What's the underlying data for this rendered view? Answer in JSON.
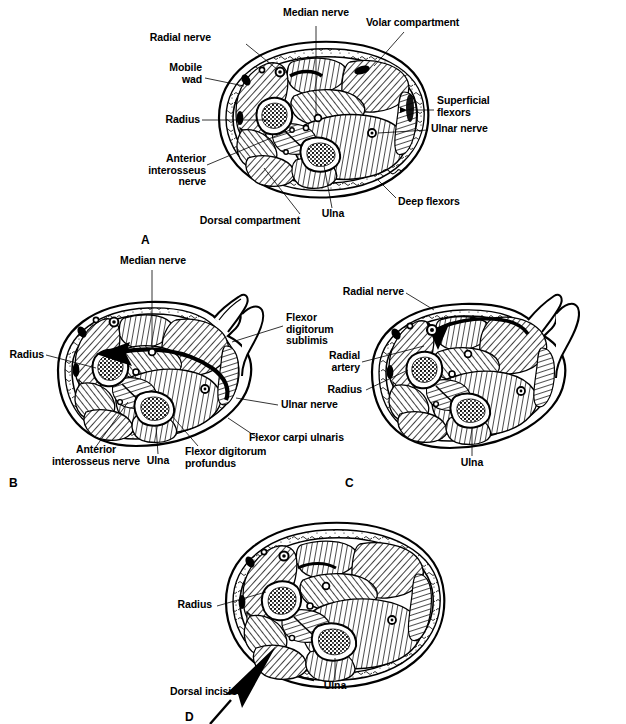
{
  "figure": {
    "line_color": "#000000",
    "background_color": "#ffffff"
  },
  "panels": [
    {
      "id": "A",
      "letter": "A",
      "caption": "Normal forearm cross-section anatomy",
      "labels": [
        {
          "name": "median-nerve",
          "text": "Median nerve"
        },
        {
          "name": "volar-compartment",
          "text": "Volar compartment"
        },
        {
          "name": "radial-nerve",
          "text": "Radial nerve"
        },
        {
          "name": "mobile-wad",
          "text": "Mobile\nwad"
        },
        {
          "name": "superficial-flexors",
          "text": "Superficial\nflexors"
        },
        {
          "name": "radius",
          "text": "Radius"
        },
        {
          "name": "ulnar-nerve",
          "text": "Ulnar nerve"
        },
        {
          "name": "anterior-interosseus-nerve",
          "text": "Anterior\ninterosseus\nnerve"
        },
        {
          "name": "deep-flexors",
          "text": "Deep flexors"
        },
        {
          "name": "dorsal-compartment",
          "text": "Dorsal compartment"
        },
        {
          "name": "ulna",
          "text": "Ulna"
        }
      ]
    },
    {
      "id": "B",
      "letter": "B",
      "caption": "Volar fasciotomy release with arrow through median nerve level",
      "labels": [
        {
          "name": "median-nerve",
          "text": "Median nerve"
        },
        {
          "name": "flexor-digitorum-sublimis",
          "text": "Flexor\ndigitorum\nsublimis"
        },
        {
          "name": "radius",
          "text": "Radius"
        },
        {
          "name": "ulnar-nerve",
          "text": "Ulnar nerve"
        },
        {
          "name": "flexor-carpi-ulnaris",
          "text": "Flexor carpi ulnaris"
        },
        {
          "name": "anterior-interosseus-nerve",
          "text": "Anterior\ninterosseus nerve"
        },
        {
          "name": "ulna",
          "text": "Ulna"
        },
        {
          "name": "flexor-digitorum-profundus",
          "text": "Flexor digitorum\nprofundus"
        }
      ]
    },
    {
      "id": "C",
      "letter": "C",
      "caption": "Mobile wad release showing radial nerve and radial artery",
      "labels": [
        {
          "name": "radial-nerve",
          "text": "Radial nerve"
        },
        {
          "name": "radial-artery",
          "text": "Radial\nartery"
        },
        {
          "name": "radius",
          "text": "Radius"
        },
        {
          "name": "ulna",
          "text": "Ulna"
        }
      ]
    },
    {
      "id": "D",
      "letter": "D",
      "caption": "Dorsal compartment release",
      "labels": [
        {
          "name": "radius",
          "text": "Radius"
        },
        {
          "name": "dorsal-incision",
          "text": "Dorsal incision"
        },
        {
          "name": "ulna",
          "text": "Ulna"
        }
      ]
    }
  ]
}
